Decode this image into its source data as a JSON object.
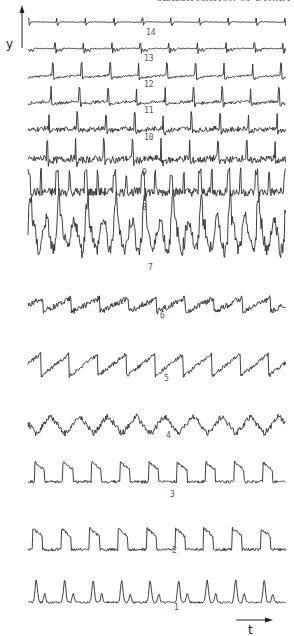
{
  "page": {
    "header_fragment": "CLASSIFICATION OF DYNAMICS"
  },
  "figure": {
    "y_axis_label": "y",
    "t_axis_label": "t",
    "trace_count": 14,
    "traces": [
      {
        "id": 14,
        "label": "14",
        "type": "sparse-spike",
        "baseline_y": 22,
        "label_x": 146,
        "label_y": 35,
        "amp": 4,
        "noise": 0.3
      },
      {
        "id": 13,
        "label": "13",
        "type": "spike-burst",
        "baseline_y": 48,
        "label_x": 144,
        "label_y": 61,
        "amp": 5,
        "noise": 0.6
      },
      {
        "id": 12,
        "label": "12",
        "type": "spike-plateau",
        "baseline_y": 75,
        "label_x": 144,
        "label_y": 87,
        "amp": 10,
        "noise": 1.0
      },
      {
        "id": 11,
        "label": "11",
        "type": "spike-plateau",
        "baseline_y": 101,
        "label_x": 144,
        "label_y": 113,
        "amp": 11,
        "noise": 1.5
      },
      {
        "id": 10,
        "label": "10",
        "type": "spike-noisy",
        "baseline_y": 128,
        "label_x": 144,
        "label_y": 140,
        "amp": 12,
        "noise": 2.5
      },
      {
        "id": 9,
        "label": "9",
        "type": "spike-noisy",
        "baseline_y": 158,
        "label_x": 142,
        "label_y": 175,
        "amp": 14,
        "noise": 3.5
      },
      {
        "id": 8,
        "label": "8",
        "type": "dense-noisy",
        "baseline_y": 190,
        "label_x": 142,
        "label_y": 210,
        "amp": 18,
        "noise": 4.5
      },
      {
        "id": 7,
        "label": "7",
        "type": "chaotic",
        "baseline_y": 235,
        "label_x": 148,
        "label_y": 270,
        "amp": 30,
        "noise": 8
      },
      {
        "id": 6,
        "label": "6",
        "type": "sawtooth-noisy",
        "baseline_y": 305,
        "label_x": 160,
        "label_y": 318,
        "amp": 14,
        "noise": 3
      },
      {
        "id": 5,
        "label": "5",
        "type": "sawtooth",
        "baseline_y": 365,
        "label_x": 164,
        "label_y": 381,
        "amp": 22,
        "noise": 2
      },
      {
        "id": 4,
        "label": "4",
        "type": "triangular-noisy",
        "baseline_y": 425,
        "label_x": 166,
        "label_y": 438,
        "amp": 18,
        "noise": 3
      },
      {
        "id": 3,
        "label": "3",
        "type": "bursting",
        "baseline_y": 473,
        "label_x": 170,
        "label_y": 497,
        "amp": 22,
        "noise": 1.5
      },
      {
        "id": 2,
        "label": "2",
        "type": "bursting",
        "baseline_y": 540,
        "label_x": 172,
        "label_y": 553,
        "amp": 24,
        "noise": 1.5
      },
      {
        "id": 1,
        "label": "1",
        "type": "peaks",
        "baseline_y": 598,
        "label_x": 174,
        "label_y": 610,
        "amp": 22,
        "noise": 1
      }
    ],
    "trace_x_start": 28,
    "trace_x_end": 286,
    "period_px": 28.5
  },
  "colors": {
    "ink": "#2b2b2b",
    "label": "#555555",
    "background": "#ffffff"
  }
}
